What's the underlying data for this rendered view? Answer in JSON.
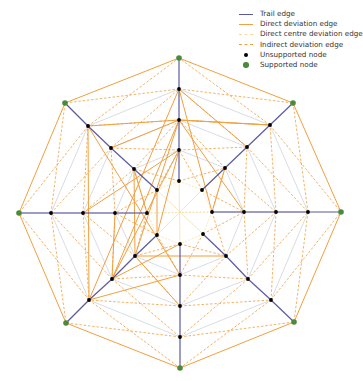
{
  "legend": {
    "items": [
      {
        "label": "Trail edge",
        "kind": "line",
        "color": "#5b5a9e"
      },
      {
        "label": "Direct deviation edge",
        "kind": "line",
        "color": "#f0a040"
      },
      {
        "label": "Direct centre deviation edge",
        "kind": "dash",
        "color": "#f5dca0"
      },
      {
        "label": "Indirect deviation edge",
        "kind": "dash",
        "color": "#f0a040"
      },
      {
        "label": "Unsupported node",
        "kind": "dot",
        "color": "#000000"
      },
      {
        "label": "Supported node",
        "kind": "bigdot",
        "color": "#4a8a3a"
      }
    ]
  },
  "colors": {
    "trail": "#5b5a9e",
    "direct": "#f0a040",
    "centre": "#f5dca0",
    "indirect": "#f0a040",
    "ring": "#d4d8e2",
    "unsupported": "#000000",
    "supported": "#4a8a3a"
  },
  "center": [
    179.5,
    212.5
  ],
  "trails": [
    {
      "name": "top",
      "nodes": [
        [
          179,
          181
        ],
        [
          179,
          150
        ],
        [
          179,
          120
        ],
        [
          179,
          89
        ]
      ],
      "support": [
        179,
        58
      ]
    },
    {
      "name": "top-right",
      "nodes": [
        [
          202,
          190
        ],
        [
          225,
          168
        ],
        [
          247,
          147
        ],
        [
          270,
          125
        ]
      ],
      "support": [
        293,
        103
      ]
    },
    {
      "name": "right",
      "nodes": [
        [
          212,
          212
        ],
        [
          244,
          212
        ],
        [
          276,
          212
        ],
        [
          308,
          212
        ]
      ],
      "support": [
        341,
        212
      ]
    },
    {
      "name": "bottom-right",
      "nodes": [
        [
          203,
          234
        ],
        [
          226,
          256
        ],
        [
          248,
          279
        ],
        [
          271,
          300
        ]
      ],
      "support": [
        294,
        322
      ]
    },
    {
      "name": "bottom",
      "nodes": [
        [
          180,
          244
        ],
        [
          180,
          275
        ],
        [
          180,
          306
        ],
        [
          180,
          337
        ]
      ],
      "support": [
        180,
        368
      ]
    },
    {
      "name": "bottom-left",
      "nodes": [
        [
          157,
          235
        ],
        [
          135,
          256
        ],
        [
          112,
          279
        ],
        [
          89,
          300
        ]
      ],
      "support": [
        66,
        323
      ]
    },
    {
      "name": "left",
      "nodes": [
        [
          147,
          213
        ],
        [
          115,
          213
        ],
        [
          83,
          213
        ],
        [
          51,
          213
        ]
      ],
      "support": [
        19,
        213
      ]
    },
    {
      "name": "top-left",
      "nodes": [
        [
          157,
          190
        ],
        [
          134,
          169
        ],
        [
          111,
          148
        ],
        [
          88,
          126
        ]
      ],
      "support": [
        65,
        103
      ]
    }
  ]
}
